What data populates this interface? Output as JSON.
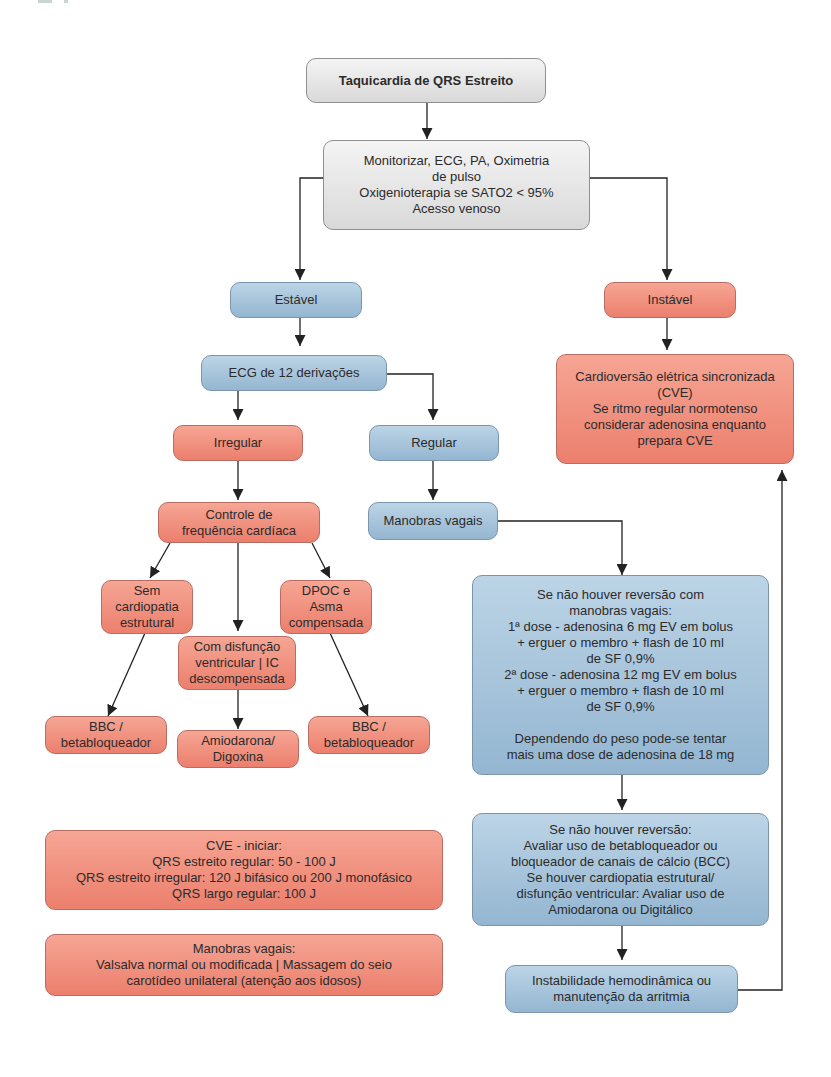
{
  "flowchart": {
    "title": "Taquicardia de QRS Estreito",
    "nodes": {
      "start": [
        "Taquicardia de QRS Estreito"
      ],
      "monitor": [
        "Monitorizar, ECG, PA, Oximetria",
        "de pulso",
        "Oxigenioterapia se SATO2 < 95%",
        "Acesso venoso"
      ],
      "stable": [
        "Estável"
      ],
      "unstable": [
        "Instável"
      ],
      "cve": [
        "Cardioversão elétrica sincronizada",
        "(CVE)",
        "Se ritmo regular normotenso",
        "considerar adenosina enquanto",
        "prepara CVE"
      ],
      "ecg12": [
        "ECG de 12 derivações"
      ],
      "irregular": [
        "Irregular"
      ],
      "regular": [
        "Regular"
      ],
      "rate_control": [
        "Controle de",
        "frequência cardíaca"
      ],
      "vagal": [
        "Manobras vagais"
      ],
      "no_structural": [
        "Sem",
        "cardiopatia",
        "estrutural"
      ],
      "copd": [
        "DPOC e",
        "Asma",
        "compensada"
      ],
      "ventricular_dysfunction": [
        "Com disfunção",
        "ventricular | IC",
        "descompensada"
      ],
      "bbc_left": [
        "BBC /",
        "betabloqueador"
      ],
      "amiodarone": [
        "Amiodarona/",
        "Digoxina"
      ],
      "bbc_right": [
        "BBC /",
        "betabloqueador"
      ],
      "adenosine": [
        "Se não houver reversão com",
        "manobras vagais:",
        "1ª dose - adenosina 6 mg EV em bolus",
        "+ erguer o membro + flash de 10 ml",
        "de SF 0,9%",
        "2ª dose - adenosina 12 mg EV em bolus",
        "+ erguer o membro + flash de 10 ml",
        "de SF 0,9%",
        " ",
        "Dependendo do peso pode-se tentar",
        "mais uma dose de adenosina de 18 mg"
      ],
      "no_reversion": [
        "Se não houver reversão:",
        "Avaliar uso de betabloqueador ou",
        "bloqueador de canais de cálcio (BCC)",
        "Se houver cardiopatia estrutural/",
        "disfunção ventricular: Avaliar uso de",
        "Amiodarona ou Digitálico"
      ],
      "instability": [
        "Instabilidade hemodinâmica ou",
        "manutenção da arritmia"
      ],
      "cve_energy": [
        "CVE - iniciar:",
        "QRS estreito regular: 50 - 100 J",
        "QRS estreito irregular: 120 J bifásico ou 200 J monofásico",
        "QRS largo regular: 100 J"
      ],
      "vagal_info": [
        "Manobras vagais:",
        "Valsalva normal ou modificada | Massagem do seio",
        "carotídeo unilateral (atenção aos idosos)"
      ]
    },
    "colors": {
      "gray": "#d9d9d9",
      "blue": "#a7c4dc",
      "red": "#f19282",
      "line": "#222222"
    }
  }
}
